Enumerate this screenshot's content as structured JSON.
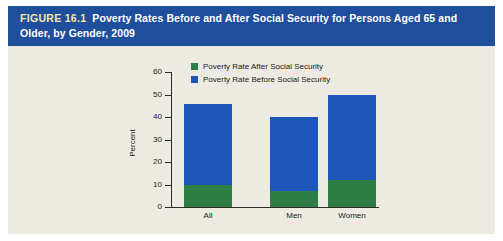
{
  "figure": {
    "number_label": "FIGURE 16.1",
    "title": "Poverty Rates Before and After Social Security for Persons Aged 65 and Older, by Gender, 2009",
    "banner_color": "#1f4e9c",
    "number_color": "#f3e9a8",
    "canvas_color": "#eceae1"
  },
  "chart_data": {
    "type": "bar",
    "title": "",
    "categories": [
      "All",
      "Men",
      "Women"
    ],
    "series": [
      {
        "name": "Poverty Rate Before Social Security",
        "color": "#1d56b8",
        "values": [
          46,
          40,
          50
        ]
      },
      {
        "name": "Poverty Rate After Social Security",
        "color": "#2e7d45",
        "values": [
          10,
          7,
          12
        ]
      }
    ],
    "xlabel": "",
    "ylabel": "Percent",
    "ylim": [
      0,
      60
    ],
    "yticks": [
      0,
      10,
      20,
      30,
      40,
      50,
      60
    ],
    "ytick_labels": [
      "0",
      "10",
      "20",
      "30",
      "40",
      "50",
      "60"
    ],
    "grid": false,
    "legend_position": "top-center",
    "overlay_style": "overlaid"
  }
}
